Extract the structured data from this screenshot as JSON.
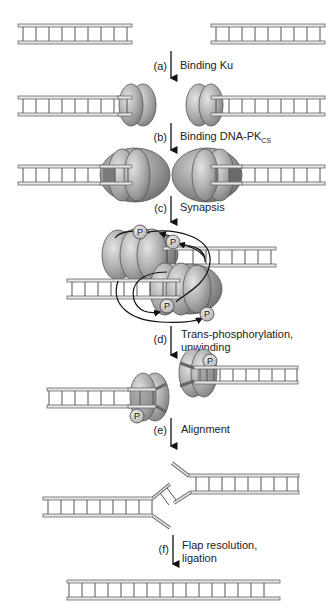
{
  "figure": {
    "colors": {
      "dna_rail": "#e6e6e6",
      "dna_outline": "#666666",
      "ku_protein": "#a8a8a8",
      "dna_pkcs": "#8a8a8a",
      "phosphate": "#cfcfcf",
      "text": "#222222"
    },
    "steps": [
      {
        "letter": "(a)",
        "label": "Binding Ku",
        "label_line2": ""
      },
      {
        "letter": "(b)",
        "label": "Binding DNA-PK",
        "subscript": "CS",
        "label_line2": ""
      },
      {
        "letter": "(c)",
        "label": "Synapsis",
        "label_line2": ""
      },
      {
        "letter": "(d)",
        "label": "Trans-phosphorylation,",
        "label_line2": "unwinding"
      },
      {
        "letter": "(e)",
        "label": "Alignment",
        "label_line2": ""
      },
      {
        "letter": "(f)",
        "label": "Flap resolution,",
        "label_line2": "ligation"
      }
    ],
    "phosphate_label": "P",
    "stages": [
      {
        "name": "broken-dna-ends"
      },
      {
        "name": "ku-bound-ends"
      },
      {
        "name": "dna-pkcs-bound-ends"
      },
      {
        "name": "synaptic-complex"
      },
      {
        "name": "unwound-ends"
      },
      {
        "name": "aligned-ends-with-flaps"
      },
      {
        "name": "ligated-dna"
      }
    ]
  }
}
